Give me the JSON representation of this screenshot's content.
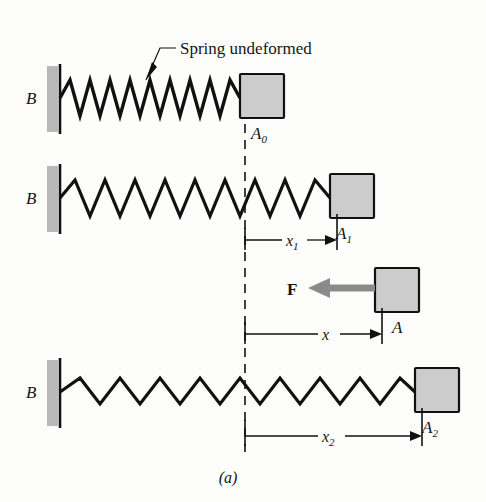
{
  "figure": {
    "caption": "(a)",
    "annotation": "Spring undeformed",
    "background_color": "#fdfdfc",
    "ink_color": "#111111",
    "force_color": "#8a8a8a",
    "block_fill": "#cccccc",
    "wall_fill": "#b9b9b9"
  },
  "rows": [
    {
      "id": "undeformed",
      "wall_label": "B",
      "block_label": "A",
      "block_subscript": "0",
      "spring_coils": 9,
      "spring_state": "undeformed",
      "dimension": null
    },
    {
      "id": "stretched-1",
      "wall_label": "B",
      "block_label": "A",
      "block_subscript": "1",
      "spring_coils": 9,
      "spring_state": "stretched",
      "dimension": {
        "label": "x",
        "subscript": "1"
      }
    },
    {
      "id": "free-body",
      "wall_label": null,
      "block_label": "A",
      "block_subscript": "",
      "spring_coils": 0,
      "spring_state": "none",
      "force_label": "F",
      "dimension": {
        "label": "x",
        "subscript": ""
      }
    },
    {
      "id": "stretched-2",
      "wall_label": "B",
      "block_label": "A",
      "block_subscript": "2",
      "spring_coils": 9,
      "spring_state": "stretched-max",
      "dimension": {
        "label": "x",
        "subscript": "2"
      }
    }
  ],
  "geometry": {
    "reference_line_x": 245,
    "reference_line_top": 124,
    "reference_line_bottom": 452
  }
}
